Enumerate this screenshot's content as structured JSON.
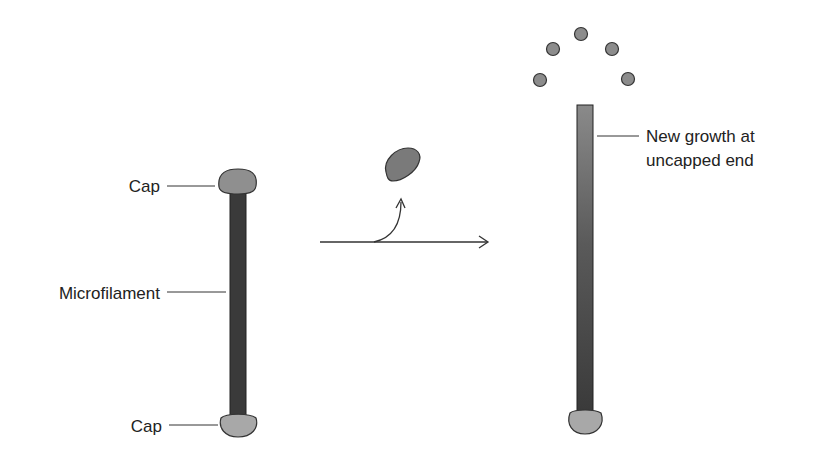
{
  "diagram": {
    "left": {
      "top_cap_label": "Cap",
      "filament_label": "Microfilament",
      "bottom_cap_label": "Cap"
    },
    "right": {
      "growth_label_line1": "New growth at",
      "growth_label_line2": "uncapped end"
    },
    "colors": {
      "filament_dark": "#3a3a3a",
      "filament_gradient_top": "#8a8a8a",
      "cap": "#8f8f8f",
      "cap_light": "#a8a8a8",
      "monomer": "#8c8c8c",
      "line": "#333333"
    }
  }
}
